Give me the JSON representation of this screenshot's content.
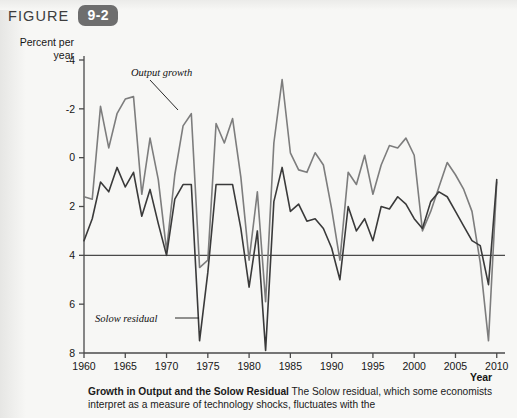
{
  "figure": {
    "label": "FIGURE",
    "number": "9-2"
  },
  "axes": {
    "y_title_line1": "Percent per",
    "y_title_line2": "year",
    "x_title": "Year",
    "y_ticks": [
      "8",
      "6",
      "4",
      "2",
      "0",
      "-2",
      "-4"
    ],
    "x_ticks": [
      "1960",
      "1965",
      "1970",
      "1975",
      "1980",
      "1985",
      "1990",
      "1995",
      "2000",
      "2005",
      "2010"
    ]
  },
  "annotations": {
    "output_growth": "Output growth",
    "solow_residual": "Solow residual"
  },
  "caption": {
    "title": "Growth in Output and the Solow Residual",
    "body": " The Solow residual, which some economists interpret as a measure of technology shocks, fluctuates with the"
  },
  "colors": {
    "output_growth": "#7d7d7d",
    "solow_residual": "#3a3a3a",
    "axis": "#4a4a4a",
    "badge": "#6e6e6e",
    "page": "#f7f7f5"
  },
  "chart_data": {
    "type": "line",
    "title": "Growth in Output and the Solow Residual",
    "xlabel": "Year",
    "ylabel": "Percent per year",
    "xlim": [
      1960,
      2011
    ],
    "ylim": [
      -4,
      8
    ],
    "yticks": [
      -4,
      -2,
      0,
      2,
      4,
      6,
      8
    ],
    "xticks": [
      1960,
      1965,
      1970,
      1975,
      1980,
      1985,
      1990,
      1995,
      2000,
      2005,
      2010
    ],
    "grid": false,
    "legend": "inline-annotations",
    "x": [
      1960,
      1961,
      1962,
      1963,
      1964,
      1965,
      1966,
      1967,
      1968,
      1969,
      1970,
      1971,
      1972,
      1973,
      1974,
      1975,
      1976,
      1977,
      1978,
      1979,
      1980,
      1981,
      1982,
      1983,
      1984,
      1985,
      1986,
      1987,
      1988,
      1989,
      1990,
      1991,
      1992,
      1993,
      1994,
      1995,
      1996,
      1997,
      1998,
      1999,
      2000,
      2001,
      2002,
      2003,
      2004,
      2005,
      2006,
      2007,
      2008,
      2009,
      2010
    ],
    "series": [
      {
        "name": "Output growth",
        "color": "#7d7d7d",
        "values": [
          2.4,
          2.3,
          6.1,
          4.4,
          5.8,
          6.4,
          6.5,
          2.5,
          4.8,
          3.1,
          0.2,
          3.3,
          5.3,
          5.8,
          -0.5,
          -0.2,
          5.4,
          4.6,
          5.6,
          3.2,
          -0.2,
          2.6,
          -1.9,
          4.6,
          7.2,
          4.2,
          3.5,
          3.4,
          4.2,
          3.7,
          1.9,
          -0.2,
          3.4,
          2.9,
          4.1,
          2.5,
          3.7,
          4.5,
          4.4,
          4.8,
          4.1,
          1.0,
          1.8,
          2.8,
          3.8,
          3.3,
          2.7,
          1.8,
          -0.3,
          -3.5,
          3.0
        ]
      },
      {
        "name": "Solow residual",
        "color": "#3a3a3a",
        "values": [
          0.6,
          1.5,
          3.0,
          2.6,
          3.6,
          2.8,
          3.4,
          1.6,
          2.7,
          1.3,
          0.0,
          2.3,
          2.9,
          2.9,
          -3.5,
          -0.7,
          2.9,
          2.9,
          2.9,
          1.1,
          -1.3,
          1.0,
          -3.9,
          2.2,
          3.6,
          1.8,
          2.1,
          1.4,
          1.5,
          1.1,
          0.3,
          -1.0,
          2.0,
          1.0,
          1.5,
          0.6,
          2.0,
          1.9,
          2.4,
          2.1,
          1.5,
          1.1,
          2.2,
          2.6,
          2.4,
          1.8,
          1.2,
          0.6,
          0.4,
          -1.2,
          3.1
        ]
      }
    ]
  }
}
